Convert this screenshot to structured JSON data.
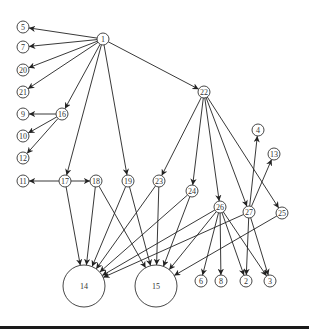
{
  "diagram": {
    "type": "directed-graph",
    "nodes": [
      {
        "id": "1",
        "label": "1",
        "x": 103,
        "y": 39,
        "r": 6
      },
      {
        "id": "5",
        "label": "5",
        "x": 23,
        "y": 27,
        "r": 6
      },
      {
        "id": "7",
        "label": "7",
        "x": 23,
        "y": 47,
        "r": 6
      },
      {
        "id": "20",
        "label": "20",
        "x": 23,
        "y": 70,
        "r": 6
      },
      {
        "id": "21",
        "label": "21",
        "x": 23,
        "y": 92,
        "r": 6
      },
      {
        "id": "16",
        "label": "16",
        "x": 62,
        "y": 114,
        "r": 6
      },
      {
        "id": "9",
        "label": "9",
        "x": 23,
        "y": 114,
        "r": 6
      },
      {
        "id": "10",
        "label": "10",
        "x": 23,
        "y": 136,
        "r": 6
      },
      {
        "id": "12",
        "label": "12",
        "x": 23,
        "y": 158,
        "r": 6
      },
      {
        "id": "11",
        "label": "11",
        "x": 23,
        "y": 181,
        "r": 6
      },
      {
        "id": "17",
        "label": "17",
        "x": 65,
        "y": 181,
        "r": 6
      },
      {
        "id": "18",
        "label": "18",
        "x": 96,
        "y": 181,
        "r": 6
      },
      {
        "id": "19",
        "label": "19",
        "x": 128,
        "y": 181,
        "r": 6
      },
      {
        "id": "22",
        "label": "22",
        "x": 204,
        "y": 92,
        "r": 6
      },
      {
        "id": "23",
        "label": "23",
        "x": 159,
        "y": 181,
        "r": 6
      },
      {
        "id": "24",
        "label": "24",
        "x": 192,
        "y": 191,
        "r": 6
      },
      {
        "id": "26",
        "label": "26",
        "x": 220,
        "y": 207,
        "r": 6
      },
      {
        "id": "27",
        "label": "27",
        "x": 249,
        "y": 212,
        "r": 6
      },
      {
        "id": "25",
        "label": "25",
        "x": 282,
        "y": 213,
        "r": 6
      },
      {
        "id": "4",
        "label": "4",
        "x": 258,
        "y": 130,
        "r": 6
      },
      {
        "id": "13",
        "label": "13",
        "x": 274,
        "y": 154,
        "r": 6
      },
      {
        "id": "14",
        "label": "14",
        "x": 84,
        "y": 286,
        "r": 21
      },
      {
        "id": "15",
        "label": "15",
        "x": 156,
        "y": 286,
        "r": 21
      },
      {
        "id": "6",
        "label": "6",
        "x": 201,
        "y": 281,
        "r": 6
      },
      {
        "id": "8",
        "label": "8",
        "x": 221,
        "y": 281,
        "r": 6
      },
      {
        "id": "2",
        "label": "2",
        "x": 246,
        "y": 281,
        "r": 6
      },
      {
        "id": "3",
        "label": "3",
        "x": 270,
        "y": 281,
        "r": 6
      }
    ],
    "edges": [
      {
        "from": "1",
        "to": "5"
      },
      {
        "from": "1",
        "to": "7"
      },
      {
        "from": "1",
        "to": "20"
      },
      {
        "from": "1",
        "to": "21"
      },
      {
        "from": "1",
        "to": "16"
      },
      {
        "from": "1",
        "to": "17"
      },
      {
        "from": "1",
        "to": "19"
      },
      {
        "from": "1",
        "to": "22"
      },
      {
        "from": "16",
        "to": "9"
      },
      {
        "from": "16",
        "to": "10"
      },
      {
        "from": "16",
        "to": "12"
      },
      {
        "from": "17",
        "to": "11"
      },
      {
        "from": "17",
        "to": "18"
      },
      {
        "from": "17",
        "to": "14"
      },
      {
        "from": "18",
        "to": "14"
      },
      {
        "from": "18",
        "to": "15"
      },
      {
        "from": "19",
        "to": "14"
      },
      {
        "from": "19",
        "to": "15"
      },
      {
        "from": "22",
        "to": "23"
      },
      {
        "from": "22",
        "to": "24"
      },
      {
        "from": "22",
        "to": "26"
      },
      {
        "from": "22",
        "to": "27"
      },
      {
        "from": "22",
        "to": "25"
      },
      {
        "from": "23",
        "to": "14"
      },
      {
        "from": "23",
        "to": "15"
      },
      {
        "from": "24",
        "to": "14"
      },
      {
        "from": "24",
        "to": "15"
      },
      {
        "from": "26",
        "to": "14"
      },
      {
        "from": "26",
        "to": "15"
      },
      {
        "from": "26",
        "to": "6"
      },
      {
        "from": "26",
        "to": "8"
      },
      {
        "from": "26",
        "to": "2"
      },
      {
        "from": "26",
        "to": "3"
      },
      {
        "from": "27",
        "to": "14"
      },
      {
        "from": "27",
        "to": "4"
      },
      {
        "from": "27",
        "to": "13"
      },
      {
        "from": "27",
        "to": "2"
      },
      {
        "from": "27",
        "to": "3"
      },
      {
        "from": "25",
        "to": "15"
      }
    ]
  }
}
